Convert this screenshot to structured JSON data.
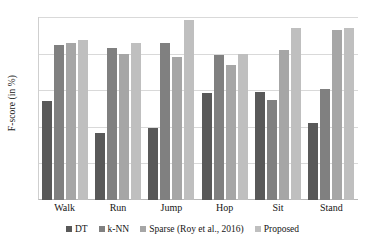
{
  "chart_data": {
    "type": "bar",
    "title": "",
    "xlabel": "",
    "ylabel": "F-score (in %)",
    "ylim": [
      75,
      100
    ],
    "yticks": [
      75,
      80,
      85,
      90,
      95,
      100
    ],
    "grid": true,
    "legend_position": "bottom",
    "categories": [
      "Walk",
      "Run",
      "Jump",
      "Hop",
      "Sit",
      "Stand"
    ],
    "series": [
      {
        "name": "DT",
        "color": "#595959",
        "values": [
          88.5,
          84.1,
          84.8,
          89.6,
          89.7,
          85.5
        ]
      },
      {
        "name": "k-NN",
        "color": "#808080",
        "values": [
          96.2,
          95.7,
          96.5,
          94.8,
          88.6,
          90.2
        ]
      },
      {
        "name": "Sparse (Roy et al., 2016)",
        "color": "#a6a6a6",
        "values": [
          96.5,
          95.0,
          94.6,
          93.5,
          95.5,
          98.2
        ]
      },
      {
        "name": "Proposed",
        "color": "#bfbfbf",
        "values": [
          96.8,
          96.4,
          99.6,
          94.9,
          98.5,
          98.5
        ]
      }
    ]
  }
}
